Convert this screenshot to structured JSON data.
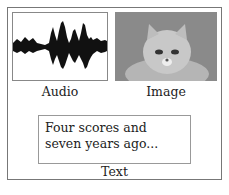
{
  "panels": {
    "audio": {
      "label": "Audio",
      "icon": "waveform-icon"
    },
    "image": {
      "label": "Image",
      "icon": "cat-photo"
    },
    "text": {
      "label": "Text",
      "content": "Four scores and seven years ago..."
    }
  }
}
